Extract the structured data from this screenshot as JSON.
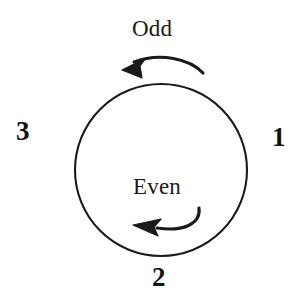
{
  "figure": {
    "type": "cycle-diagram",
    "background_color": "#ffffff",
    "stroke_color": "#1a1a1a",
    "text_color": "#1a1a1a",
    "phase_labels": {
      "outer_top": "Odd",
      "inner_bottom": "Even"
    },
    "step_numbers": {
      "right": "1",
      "bottom": "2",
      "left": "3"
    },
    "arrows": [
      {
        "name": "odd-phase-arrow",
        "position": "above-circle",
        "direction": "counterclockwise",
        "points_to": "left"
      },
      {
        "name": "even-phase-arrow",
        "position": "inside-circle-bottom",
        "direction": "counterclockwise",
        "points_to": "left"
      }
    ],
    "circle": {
      "center_x": 161,
      "center_y": 170,
      "radius": 86
    }
  }
}
